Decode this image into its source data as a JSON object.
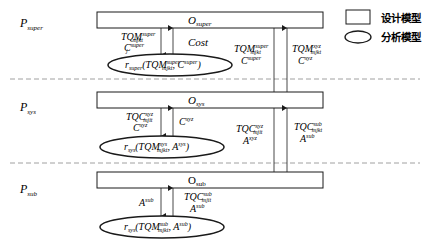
{
  "levels": {
    "super": {
      "label": "P",
      "label_sub": "super",
      "box": "O",
      "box_sub": "super",
      "ellipse": {
        "r": "r",
        "r_sub": "super",
        "arg1": "TQM",
        "arg1_sup": "super",
        "arg1_sub": "mjkt",
        "arg2": "C",
        "arg2_sup": "super",
        "arg2_sub": "j"
      },
      "down_label": {
        "line1": "TQM",
        "line1_sup": "super",
        "line1_sub": "mjkt",
        "line2": "C",
        "line2_sup": "super",
        "line2_sub": "j"
      },
      "up_label": "Cost"
    },
    "sys": {
      "label": "P",
      "label_sub": "sys",
      "box": "O",
      "box_sub": "sys",
      "ellipse": {
        "r": "r",
        "r_sub": "sys",
        "arg1": "TQM",
        "arg1_sup": "sys",
        "arg1_sub": "mjkt",
        "arg2": "A",
        "arg2_sup": "sys",
        "arg2_sub": "i"
      },
      "down_label": {
        "line1": "TQC",
        "line1_sup": "xyz",
        "line1_sub": "mjit",
        "line2": "C",
        "line2_sup": "xyz",
        "line2_sub": "j"
      },
      "up_label": {
        "line1": "C",
        "line1_sup": "xyz",
        "line1_sub": "j"
      }
    },
    "sub": {
      "label": "P",
      "label_sub": "sub",
      "box": "O",
      "box_sub": "sub",
      "ellipse": {
        "r": "r",
        "r_sub": "sys",
        "arg1": "TQM",
        "arg1_sup": "sub",
        "arg1_sub": "mjkt",
        "arg2": "A",
        "arg2_sup": "sub",
        "arg2_sub": "i"
      },
      "down_label": {
        "line1": "A",
        "line1_sup": "sub",
        "line1_sub": "i"
      },
      "up_label": {
        "line1": "TQC",
        "line1_sup": "sub",
        "line1_sub": "mjit",
        "line2": "A",
        "line2_sup": "sub",
        "line2_sub": "i"
      }
    }
  },
  "inter_level": {
    "super_to_sys_down": {
      "line1": "TQM",
      "line1_sup": "super",
      "line1_sub": "mjkt",
      "line2": "C",
      "line2_sup": "super",
      "line2_sub": "j"
    },
    "sys_to_super_up": {
      "line1": "TQM",
      "line1_sup": "xyz",
      "line1_sub": "mjkt",
      "line2": "C",
      "line2_sup": "xyz",
      "line2_sub": "j"
    },
    "sys_to_sub_down": {
      "line1": "TQC",
      "line1_sup": "xyz",
      "line1_sub": "mjit",
      "line2": "A",
      "line2_sup": "xyz",
      "line2_sub": "i"
    },
    "sub_to_sys_up": {
      "line1": "TQC",
      "line1_sup": "sub",
      "line1_sub": "mjkt",
      "line2": "A",
      "line2_sup": "sub",
      "line2_sub": "i"
    }
  },
  "legend": {
    "design_model": "设计模型",
    "analysis_model": "分析模型"
  }
}
